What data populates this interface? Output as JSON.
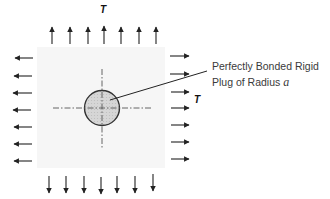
{
  "diagram": {
    "load_labels": {
      "top": "T",
      "right": "T"
    },
    "plug_label": {
      "line1": "Perfectly Bonded Rigid",
      "line2_prefix": "Plug of Radius ",
      "line2_symbol": "a"
    },
    "arrow_counts": {
      "top": 7,
      "bottom": 7,
      "left": 7,
      "right": 7
    },
    "colors": {
      "plate": "#f6f6f6",
      "plug_fill": "#d4d4d4",
      "stroke": "#222222",
      "centerline": "#555555"
    }
  }
}
